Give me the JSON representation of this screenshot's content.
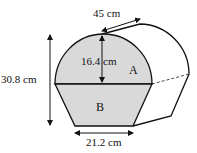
{
  "diagram": {
    "type": "prism-solid",
    "labels": {
      "length": "45 cm",
      "semicircle_height": "16.4 cm",
      "total_height": "30.8 cm",
      "base_width": "21.2 cm",
      "region_a": "A",
      "region_b": "B"
    },
    "colors": {
      "fill": "#d9d9d9",
      "stroke": "#111111",
      "background": "#ffffff"
    }
  }
}
